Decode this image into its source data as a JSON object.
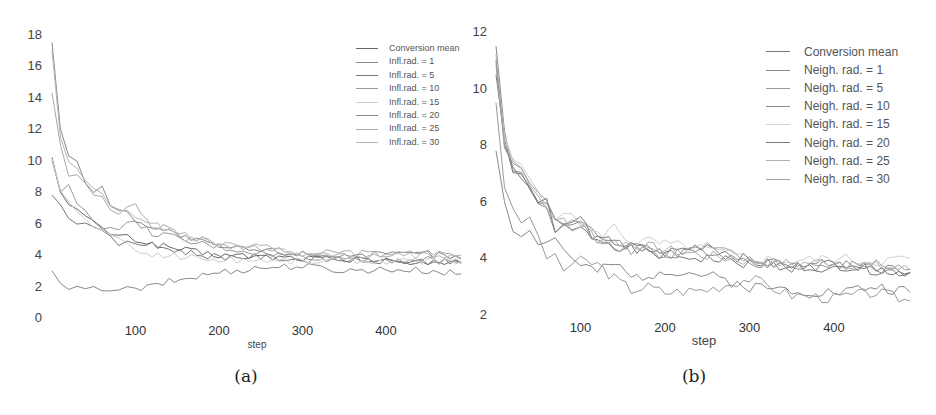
{
  "panels": [
    {
      "caption": "(a)",
      "xlabel": "step",
      "yticks": [
        "18",
        "16",
        "14",
        "12",
        "10",
        "8",
        "6",
        "4",
        "2",
        "0"
      ],
      "xticks": [
        "100",
        "200",
        "300",
        "400"
      ],
      "legend": [
        "Conversion mean",
        "Infl.rad. = 1",
        "Infl.rad. = 5",
        "Infl.rad. = 10",
        "Infl.rad. = 15",
        "Infl.rad. = 20",
        "Infl.rad. = 25",
        "Infl.rad. = 30"
      ]
    },
    {
      "caption": "(b)",
      "xlabel": "step",
      "yticks": [
        "12",
        "10",
        "8",
        "6",
        "4",
        "2"
      ],
      "xticks": [
        "100",
        "200",
        "300",
        "400"
      ],
      "legend": [
        "Conversion mean",
        "Neigh. rad. = 1",
        "Neigh. rad. = 5",
        "Neigh. rad. = 10",
        "Neigh. rad. = 15",
        "Neigh. rad. = 20",
        "Neigh. rad. = 25",
        "Neigh. rad. = 30"
      ]
    }
  ],
  "chart_data": [
    {
      "type": "line",
      "title": "(a)",
      "xlabel": "step",
      "ylabel": "",
      "xlim": [
        0,
        490
      ],
      "ylim": [
        0,
        18
      ],
      "grid": false,
      "legend_position": "upper right",
      "x": [
        0,
        10,
        20,
        30,
        40,
        50,
        60,
        70,
        80,
        90,
        100,
        120,
        140,
        160,
        180,
        200,
        250,
        300,
        350,
        400,
        450,
        490
      ],
      "series": [
        {
          "name": "Conversion mean",
          "color": "#666666",
          "values": [
            10.2,
            8.0,
            7.2,
            6.8,
            6.4,
            6.0,
            5.7,
            5.4,
            5.2,
            5.1,
            5.0,
            4.7,
            4.5,
            4.3,
            4.1,
            4.0,
            3.9,
            3.8,
            3.7,
            3.6,
            3.55,
            3.5
          ]
        },
        {
          "name": "Infl.rad. = 1",
          "color": "#888888",
          "values": [
            3.0,
            2.2,
            1.9,
            1.8,
            1.8,
            1.8,
            1.9,
            1.9,
            1.8,
            1.8,
            1.8,
            2.0,
            2.3,
            2.5,
            2.7,
            2.9,
            3.2,
            3.3,
            3.0,
            3.1,
            3.0,
            2.8
          ]
        },
        {
          "name": "Infl.rad. = 5",
          "color": "#777777",
          "values": [
            7.8,
            7.2,
            6.5,
            6.1,
            6.0,
            6.0,
            5.5,
            5.0,
            4.7,
            4.7,
            4.8,
            4.6,
            4.4,
            4.2,
            4.0,
            3.9,
            3.9,
            3.7,
            3.7,
            3.6,
            3.6,
            3.5
          ]
        },
        {
          "name": "Infl.rad. = 10",
          "color": "#999999",
          "values": [
            10.0,
            8.0,
            8.3,
            7.3,
            6.8,
            6.3,
            5.8,
            5.6,
            5.8,
            5.9,
            6.0,
            5.4,
            5.2,
            4.8,
            4.7,
            4.5,
            4.1,
            3.9,
            3.8,
            3.7,
            3.7,
            3.5
          ]
        },
        {
          "name": "Infl.rad. = 15",
          "color": "#cccccc",
          "values": [
            10.1,
            8.1,
            7.3,
            6.7,
            6.3,
            5.9,
            5.5,
            5.2,
            4.9,
            4.6,
            4.3,
            4.0,
            4.0,
            3.9,
            3.8,
            3.7,
            3.7,
            3.6,
            3.7,
            3.6,
            3.6,
            3.6
          ]
        },
        {
          "name": "Infl.rad. = 20",
          "color": "#8a8a8a",
          "values": [
            17.5,
            12.0,
            10.3,
            9.8,
            8.6,
            8.1,
            8.5,
            7.1,
            6.8,
            6.6,
            6.3,
            5.8,
            5.5,
            5.1,
            4.8,
            4.5,
            4.3,
            4.1,
            4.0,
            4.0,
            4.1,
            3.8
          ]
        },
        {
          "name": "Infl.rad. = 25",
          "color": "#aaaaaa",
          "values": [
            14.3,
            11.0,
            9.1,
            9.3,
            8.6,
            7.9,
            7.6,
            6.9,
            6.6,
            6.9,
            7.2,
            5.7,
            5.9,
            4.9,
            5.2,
            4.6,
            4.5,
            4.0,
            4.2,
            4.0,
            4.2,
            4.0
          ]
        },
        {
          "name": "Infl.rad. = 30",
          "color": "#b5b5b5",
          "values": [
            17.0,
            11.5,
            10.1,
            9.6,
            8.8,
            8.3,
            8.0,
            7.2,
            6.9,
            6.7,
            6.5,
            6.0,
            5.6,
            5.2,
            4.9,
            4.7,
            4.5,
            4.1,
            4.0,
            3.9,
            4.0,
            3.7
          ]
        }
      ]
    },
    {
      "type": "line",
      "title": "(b)",
      "xlabel": "step",
      "ylabel": "",
      "xlim": [
        0,
        490
      ],
      "ylim": [
        2,
        12
      ],
      "grid": false,
      "legend_position": "upper right",
      "x": [
        0,
        10,
        20,
        30,
        40,
        50,
        60,
        70,
        80,
        90,
        100,
        120,
        140,
        160,
        180,
        200,
        250,
        300,
        350,
        400,
        450,
        490
      ],
      "series": [
        {
          "name": "Conversion mean",
          "color": "#777777",
          "values": [
            10.5,
            8.2,
            7.1,
            6.8,
            6.4,
            6.1,
            5.8,
            5.3,
            5.1,
            5.0,
            5.0,
            4.7,
            4.5,
            4.3,
            4.2,
            4.1,
            4.0,
            3.8,
            3.7,
            3.6,
            3.6,
            3.5
          ]
        },
        {
          "name": "Neigh. rad. = 1",
          "color": "#888888",
          "values": [
            7.8,
            6.0,
            5.1,
            4.9,
            4.9,
            4.6,
            4.6,
            4.7,
            4.3,
            4.0,
            3.8,
            3.5,
            3.8,
            3.3,
            3.4,
            3.6,
            3.4,
            3.0,
            2.9,
            2.8,
            3.0,
            2.8
          ]
        },
        {
          "name": "Neigh. rad. = 5",
          "color": "#999999",
          "values": [
            9.5,
            6.5,
            5.6,
            5.3,
            5.4,
            4.9,
            3.8,
            4.2,
            3.6,
            3.8,
            3.9,
            3.8,
            3.3,
            2.9,
            3.0,
            2.8,
            2.9,
            3.3,
            2.7,
            2.6,
            2.8,
            2.5
          ]
        },
        {
          "name": "Neigh. rad. = 10",
          "color": "#8a8a8a",
          "values": [
            11.5,
            8.5,
            7.0,
            7.0,
            6.4,
            6.0,
            5.8,
            5.0,
            5.3,
            5.2,
            5.3,
            4.7,
            4.7,
            4.4,
            4.5,
            4.0,
            4.3,
            3.9,
            3.8,
            3.8,
            3.7,
            3.5
          ]
        },
        {
          "name": "Neigh. rad. = 15",
          "color": "#d0d0d0",
          "values": [
            10.8,
            8.3,
            7.5,
            7.2,
            6.8,
            6.4,
            6.0,
            5.5,
            5.4,
            5.6,
            5.3,
            4.8,
            5.1,
            4.6,
            4.6,
            4.5,
            4.3,
            4.0,
            3.9,
            4.0,
            3.9,
            4.0
          ]
        },
        {
          "name": "Neigh. rad. = 20",
          "color": "#7a7a7a",
          "values": [
            11.0,
            8.0,
            7.3,
            7.0,
            6.5,
            6.0,
            6.1,
            5.1,
            5.1,
            5.3,
            5.4,
            4.6,
            4.6,
            4.4,
            4.3,
            4.2,
            4.5,
            3.9,
            3.7,
            3.8,
            3.6,
            3.5
          ]
        },
        {
          "name": "Neigh. rad. = 25",
          "color": "#b0b0b0",
          "values": [
            11.2,
            8.1,
            7.6,
            7.3,
            6.6,
            6.2,
            5.9,
            5.2,
            5.4,
            5.0,
            5.2,
            4.7,
            4.6,
            4.5,
            4.4,
            4.3,
            4.1,
            3.9,
            3.8,
            3.9,
            3.7,
            3.6
          ]
        },
        {
          "name": "Neigh. rad. = 30",
          "color": "#a0a0a0",
          "values": [
            10.9,
            7.9,
            7.2,
            7.2,
            6.7,
            6.3,
            6.0,
            5.3,
            5.2,
            5.4,
            5.1,
            4.7,
            4.5,
            4.3,
            4.4,
            4.1,
            4.4,
            3.9,
            3.8,
            3.7,
            3.8,
            3.6
          ]
        }
      ]
    }
  ]
}
